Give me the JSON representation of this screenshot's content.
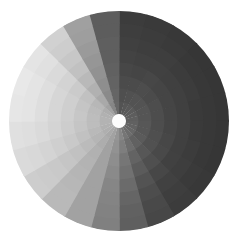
{
  "figure": {
    "background_color": "#ffffff",
    "width": 238,
    "height": 243
  },
  "chart_data": {
    "type": "heatmap",
    "subtype": "polar-sector-heatmap",
    "title": "",
    "subtitle": "",
    "xlabel": "",
    "ylabel": "",
    "legend": "none",
    "grid": false,
    "colormap": "grayscale",
    "color_min": "#282828",
    "color_max": "#ececec",
    "value_min": 0,
    "value_max": 1,
    "center_x": 119,
    "center_y": 121,
    "outer_radius": 110,
    "inner_radius": 7,
    "hub_color": "#fdfdfd",
    "n_wedges": 24,
    "n_rings": 8,
    "wedge_angle_deg": 15,
    "angle_start_deg": -90,
    "ring_labels": [
      "r1",
      "r2",
      "r3",
      "r4",
      "r5",
      "r6",
      "r7",
      "r8"
    ],
    "ring_edges": [
      7,
      20,
      33,
      46,
      59,
      72,
      85,
      98,
      110
    ],
    "wedge_labels": [
      "w01",
      "w02",
      "w03",
      "w04",
      "w05",
      "w06",
      "w07",
      "w08",
      "w09",
      "w10",
      "w11",
      "w12",
      "w13",
      "w14",
      "w15",
      "w16",
      "w17",
      "w18",
      "w19",
      "w20",
      "w21",
      "w22",
      "w23",
      "w24"
    ],
    "values": [
      [
        0.22,
        0.2,
        0.18,
        0.16,
        0.14,
        0.12,
        0.11,
        0.1
      ],
      [
        0.24,
        0.21,
        0.18,
        0.15,
        0.13,
        0.11,
        0.1,
        0.09
      ],
      [
        0.25,
        0.22,
        0.19,
        0.16,
        0.13,
        0.11,
        0.09,
        0.08
      ],
      [
        0.26,
        0.22,
        0.18,
        0.15,
        0.12,
        0.1,
        0.08,
        0.07
      ],
      [
        0.27,
        0.23,
        0.19,
        0.15,
        0.12,
        0.1,
        0.08,
        0.07
      ],
      [
        0.28,
        0.23,
        0.19,
        0.15,
        0.12,
        0.09,
        0.08,
        0.07
      ],
      [
        0.29,
        0.24,
        0.19,
        0.15,
        0.12,
        0.09,
        0.08,
        0.07
      ],
      [
        0.3,
        0.24,
        0.2,
        0.16,
        0.12,
        0.1,
        0.08,
        0.07
      ],
      [
        0.32,
        0.26,
        0.21,
        0.17,
        0.13,
        0.11,
        0.09,
        0.08
      ],
      [
        0.35,
        0.29,
        0.24,
        0.2,
        0.16,
        0.13,
        0.11,
        0.1
      ],
      [
        0.4,
        0.35,
        0.3,
        0.26,
        0.22,
        0.19,
        0.17,
        0.16
      ],
      [
        0.48,
        0.44,
        0.4,
        0.37,
        0.34,
        0.31,
        0.29,
        0.28
      ],
      [
        0.56,
        0.54,
        0.52,
        0.5,
        0.48,
        0.47,
        0.46,
        0.45
      ],
      [
        0.62,
        0.62,
        0.62,
        0.62,
        0.62,
        0.62,
        0.62,
        0.62
      ],
      [
        0.66,
        0.68,
        0.7,
        0.71,
        0.72,
        0.73,
        0.74,
        0.74
      ],
      [
        0.69,
        0.72,
        0.75,
        0.78,
        0.8,
        0.82,
        0.83,
        0.84
      ],
      [
        0.7,
        0.74,
        0.78,
        0.82,
        0.85,
        0.88,
        0.9,
        0.91
      ],
      [
        0.71,
        0.76,
        0.8,
        0.84,
        0.88,
        0.91,
        0.93,
        0.94
      ],
      [
        0.71,
        0.76,
        0.81,
        0.85,
        0.89,
        0.93,
        0.96,
        0.97
      ],
      [
        0.7,
        0.75,
        0.8,
        0.85,
        0.89,
        0.93,
        0.96,
        0.98
      ],
      [
        0.68,
        0.73,
        0.78,
        0.83,
        0.87,
        0.91,
        0.94,
        0.96
      ],
      [
        0.62,
        0.66,
        0.7,
        0.74,
        0.78,
        0.81,
        0.84,
        0.86
      ],
      [
        0.48,
        0.5,
        0.52,
        0.54,
        0.56,
        0.58,
        0.6,
        0.61
      ],
      [
        0.32,
        0.31,
        0.3,
        0.29,
        0.28,
        0.28,
        0.27,
        0.27
      ]
    ]
  },
  "accessibility": {
    "chart_role": "polar heatmap disc",
    "hub_name": "center-hub"
  }
}
